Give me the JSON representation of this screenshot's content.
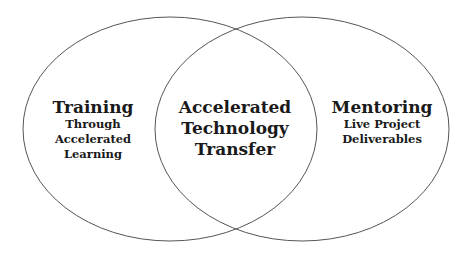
{
  "diagram": {
    "type": "venn",
    "stroke_color": "#555555",
    "sets": [
      {
        "id": "left",
        "title": "Training",
        "subtitle": [
          "Through",
          "Accelerated",
          "Learning"
        ]
      },
      {
        "id": "right",
        "title": "Mentoring",
        "subtitle": [
          "Live Project",
          "Deliverables"
        ]
      }
    ],
    "intersection": {
      "lines": [
        "Accelerated",
        "Technology",
        "Transfer"
      ]
    }
  }
}
